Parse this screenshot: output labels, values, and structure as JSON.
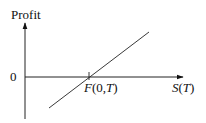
{
  "diagram": {
    "y_axis_label": "Profit",
    "zero_label": "0",
    "strike_label_F": "F",
    "strike_label_args_open": "(0,",
    "strike_label_T": "T",
    "strike_label_close": ")",
    "x_label_S": "S",
    "x_label_open": "(",
    "x_label_T": "T",
    "x_label_close": ")",
    "stroke_color": "#222222",
    "profit_line": {
      "description": "Long forward payoff: profit = S(T) - F(0,T)",
      "start": [
        49,
        108
      ],
      "end": [
        149,
        32
      ],
      "crosses_zero_at": "F(0,T)"
    }
  }
}
